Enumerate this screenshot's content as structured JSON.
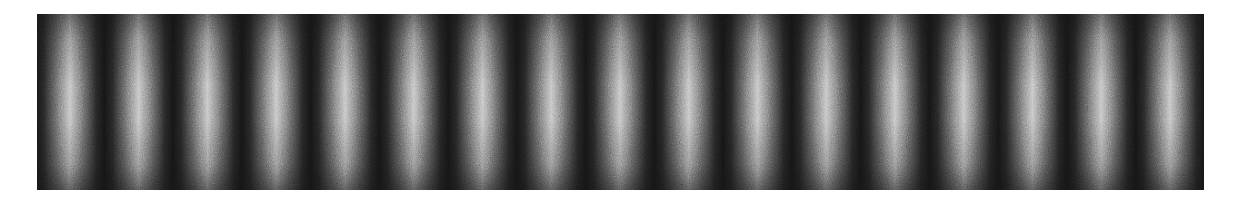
{
  "figure": {
    "panel": {
      "x": 37,
      "y": 14,
      "width": 1167,
      "height": 176
    },
    "fringes": {
      "count_bright": 17,
      "first_peak_offset_px": 33,
      "period_px": 68.75,
      "bright_color": "#c4c4c4",
      "dark_color": "#141414"
    },
    "background_color": "#ffffff"
  }
}
